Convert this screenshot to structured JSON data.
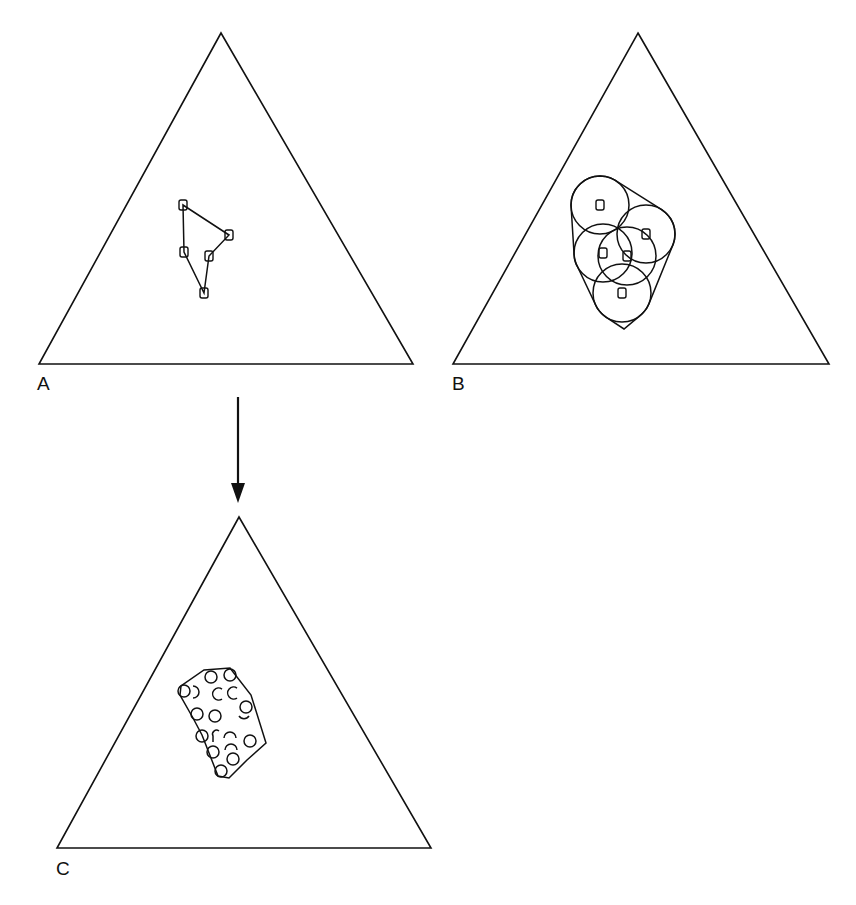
{
  "figure": {
    "width": 856,
    "height": 905,
    "line_color": "#111111",
    "background": "#ffffff"
  },
  "panels": {
    "A": {
      "label": "A",
      "description": "Data points in ternary simplex with convex hull",
      "triangle": [
        [
          221,
          33
        ],
        [
          413,
          364
        ],
        [
          39,
          364
        ]
      ],
      "points": [
        [
          183,
          205
        ],
        [
          229,
          235
        ],
        [
          184,
          252
        ],
        [
          209,
          256
        ],
        [
          204,
          293
        ]
      ],
      "hull_order": [
        0,
        1,
        3,
        4,
        2
      ]
    },
    "B": {
      "label": "B",
      "description": "Points expanded with circles (uncertainty regions) and enclosing hull",
      "triangle": [
        [
          638,
          33
        ],
        [
          829,
          364
        ],
        [
          453,
          364
        ]
      ],
      "points": [
        [
          600,
          205
        ],
        [
          646,
          234
        ],
        [
          603,
          253
        ],
        [
          627,
          256
        ],
        [
          622,
          293
        ]
      ],
      "circle_radius": 29
    },
    "C": {
      "label": "C",
      "description": "Resulting region filled with sample points",
      "triangle": [
        [
          239,
          517
        ],
        [
          431,
          848
        ],
        [
          57,
          848
        ]
      ],
      "region": [
        [
          204,
          670
        ],
        [
          230,
          668
        ],
        [
          251,
          695
        ],
        [
          266,
          743
        ],
        [
          247,
          760
        ],
        [
          229,
          778
        ],
        [
          218,
          776
        ],
        [
          202,
          735
        ],
        [
          193,
          718
        ],
        [
          180,
          695
        ],
        [
          181,
          686
        ]
      ],
      "samples": [
        {
          "cx": 184,
          "cy": 691,
          "type": "circle"
        },
        {
          "cx": 196,
          "cy": 692,
          "type": "arc-right"
        },
        {
          "cx": 211,
          "cy": 677,
          "type": "circle"
        },
        {
          "cx": 230,
          "cy": 675,
          "type": "circle"
        },
        {
          "cx": 218,
          "cy": 694,
          "type": "arc-c"
        },
        {
          "cx": 233,
          "cy": 693,
          "type": "arc-c"
        },
        {
          "cx": 246,
          "cy": 707,
          "type": "circle"
        },
        {
          "cx": 197,
          "cy": 714,
          "type": "circle"
        },
        {
          "cx": 215,
          "cy": 716,
          "type": "circle"
        },
        {
          "cx": 244,
          "cy": 717,
          "type": "arc-bottom"
        },
        {
          "cx": 202,
          "cy": 736,
          "type": "circle"
        },
        {
          "cx": 216,
          "cy": 736,
          "type": "arc-r"
        },
        {
          "cx": 230,
          "cy": 735,
          "type": "arc-top"
        },
        {
          "cx": 250,
          "cy": 741,
          "type": "circle"
        },
        {
          "cx": 213,
          "cy": 752,
          "type": "circle"
        },
        {
          "cx": 231,
          "cy": 747,
          "type": "arc-top"
        },
        {
          "cx": 233,
          "cy": 759,
          "type": "circle"
        },
        {
          "cx": 221,
          "cy": 771,
          "type": "circle"
        }
      ]
    }
  },
  "arrow": {
    "from": [
      238,
      397
    ],
    "to": [
      238,
      503
    ],
    "direction": "down",
    "meaning": "A transforms to C"
  }
}
